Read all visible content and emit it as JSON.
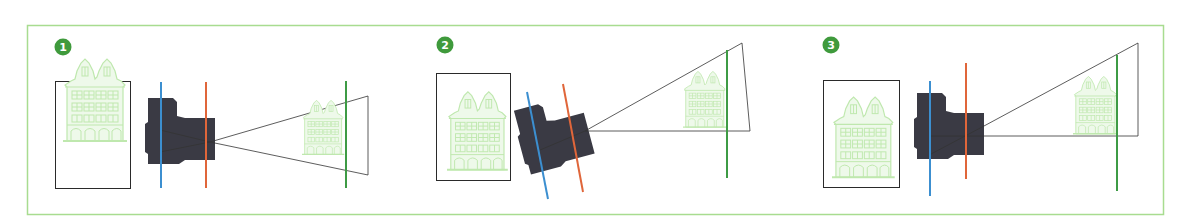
{
  "diagram": {
    "colors": {
      "frame": "#a8dc90",
      "badge": "#3f9a3c",
      "badge_text": "#ffffff",
      "sensor_plane": "#3c8fd0",
      "lens_plane": "#e0663a",
      "focus_plane": "#3e9b45",
      "camera_body": "#3a3a44",
      "building": "#bfe8ae",
      "building_fill": "#eef9ea",
      "sensor_frame": "#2a2a2a",
      "frustum": "#333333"
    },
    "panels": [
      {
        "badge": "1",
        "label": "Camera parallel: sensor, lens and focus planes parallel"
      },
      {
        "badge": "2",
        "label": "Camera tilted: sensor and lens planes tilted together"
      },
      {
        "badge": "3",
        "label": "Lens shifted: lens plane offset from sensor plane"
      }
    ]
  }
}
